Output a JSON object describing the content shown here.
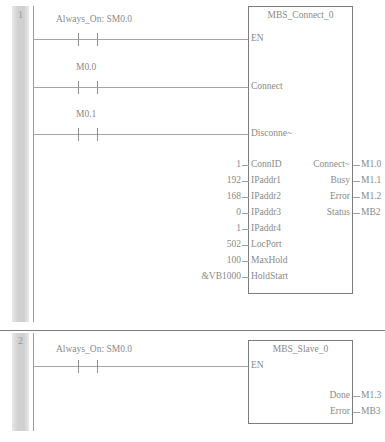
{
  "editor": {
    "language": "ladder-logic",
    "rung_separator": true
  },
  "rungs": [
    {
      "number": "1",
      "branches": [
        {
          "label": "Always_On: SM0.0",
          "type": "normally-open-contact"
        },
        {
          "label": "M0.0",
          "type": "normally-open-contact"
        },
        {
          "label": "M0.1",
          "type": "normally-open-contact"
        }
      ],
      "block": {
        "title": "MBS_Connect_0",
        "enable_pin": "EN",
        "wired_inputs": [
          "EN",
          "Connect",
          "Disconne~"
        ],
        "inputs": [
          {
            "name": "ConnID",
            "value": "1"
          },
          {
            "name": "IPaddr1",
            "value": "192"
          },
          {
            "name": "IPaddr2",
            "value": "168"
          },
          {
            "name": "IPaddr3",
            "value": "0"
          },
          {
            "name": "IPaddr4",
            "value": "1"
          },
          {
            "name": "LocPort",
            "value": "502"
          },
          {
            "name": "MaxHold",
            "value": "100"
          },
          {
            "name": "HoldStart",
            "value": "&VB1000"
          }
        ],
        "outputs": [
          {
            "name": "Connect~",
            "value": "M1.0"
          },
          {
            "name": "Busy",
            "value": "M1.1"
          },
          {
            "name": "Error",
            "value": "M1.2"
          },
          {
            "name": "Status",
            "value": "MB2"
          }
        ]
      }
    },
    {
      "number": "2",
      "branches": [
        {
          "label": "Always_On: SM0.0",
          "type": "normally-open-contact"
        }
      ],
      "block": {
        "title": "MBS_Slave_0",
        "enable_pin": "EN",
        "wired_inputs": [
          "EN"
        ],
        "inputs": [],
        "outputs": [
          {
            "name": "Done",
            "value": "M1.3"
          },
          {
            "name": "Error",
            "value": "MB3"
          }
        ]
      }
    }
  ]
}
